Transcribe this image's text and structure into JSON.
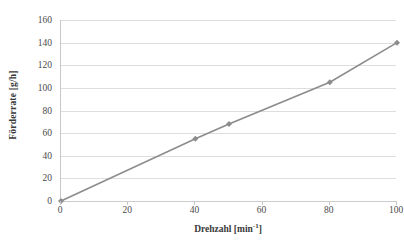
{
  "chart_data": {
    "type": "line",
    "title": "",
    "xlabel": "Drehzahl [min-1]",
    "xlabel_base": "Drehzahl [min",
    "xlabel_exponent": "-1",
    "xlabel_suffix": "]",
    "ylabel": "Förderrate [g/h]",
    "xlim": [
      0,
      100
    ],
    "ylim": [
      0,
      160
    ],
    "xticks": [
      0,
      20,
      40,
      60,
      80,
      100
    ],
    "yticks": [
      0,
      20,
      40,
      60,
      80,
      100,
      120,
      140,
      160
    ],
    "xtick_labels": [
      "0",
      "20",
      "40",
      "60",
      "80",
      "100"
    ],
    "ytick_labels": [
      "0",
      "20",
      "40",
      "60",
      "80",
      "100",
      "120",
      "140",
      "160"
    ],
    "grid": "horizontal",
    "legend": "none",
    "series": [
      {
        "name": "Förderrate",
        "color": "#8c8c8c",
        "marker": "diamond",
        "marker_color": "#8c8c8c",
        "line_width": 1.6,
        "x": [
          0,
          40,
          50,
          80,
          100
        ],
        "values": [
          0,
          55,
          68,
          105,
          140
        ]
      }
    ]
  },
  "axes": {
    "y_title": "Förderrate [g/h]",
    "x_title_base": "Drehzahl [min",
    "x_title_exponent": "-1",
    "x_title_suffix": "]"
  },
  "colors": {
    "series": "#8c8c8c",
    "gridline": "#dedede",
    "axis_line": "#c8c8c8",
    "text": "#3a3a3a",
    "background": "#ffffff"
  }
}
